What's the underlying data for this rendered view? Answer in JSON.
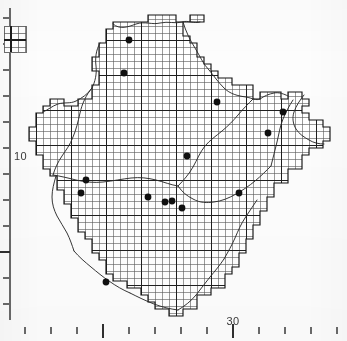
{
  "figure": {
    "background_color": "#fdfdfd",
    "ink_color": "#1a1a1a",
    "grid_color": "#4a4a4a",
    "dot_color": "#101010"
  },
  "axes": {
    "x_axis": {
      "label": "",
      "tick_labels": [
        {
          "value": "30",
          "x": 233
        }
      ],
      "minor_tick_x": [
        25,
        51,
        77,
        129,
        155,
        181,
        207,
        259,
        285,
        311,
        337
      ],
      "major_tick_x": [
        103,
        233
      ],
      "tick_y": 327,
      "minor_tick_len": 7,
      "major_tick_len": 11
    },
    "y_axis": {
      "label": "",
      "tick_labels": [
        {
          "value": "10",
          "y": 156
        }
      ],
      "axis_x": 10,
      "axis_top": 8,
      "axis_bottom": 320,
      "minor_tick_y": [
        18,
        44,
        70,
        96,
        122,
        148,
        174,
        200,
        226,
        278,
        304
      ],
      "major_tick_y": [
        252
      ],
      "minor_tick_len": 7,
      "major_tick_len": 11
    }
  },
  "inset_key": {
    "name": "scale-key-box",
    "x": 4,
    "y": 26,
    "width": 22,
    "height": 26,
    "cell_size": 7,
    "caption": ""
  },
  "map": {
    "grid": {
      "cell_size": 7.0,
      "origin_x": 29,
      "origin_y": 12,
      "bold_every": 5,
      "thin_width": 0.55,
      "bold_width": 1.0
    },
    "outline_path": "M 120 22 L 148 22 L 148 15 L 176 15 L 176 22 L 190 22 L 190 15 L 204 15 L 204 22 L 183 22 L 183 36 L 190 36 L 190 43 L 197 43 L 197 57 L 204 57 L 204 64 L 211 64 L 211 71 L 218 71 L 218 78 L 232 78 L 232 85 L 253 85 L 253 99 L 260 99 L 260 92 L 281 92 L 281 99 L 288 99 L 288 92 L 302 92 L 302 99 L 309 99 L 309 106 L 302 106 L 302 113 L 309 113 L 309 120 L 323 120 L 323 127 L 330 127 L 330 141 L 323 141 L 323 148 L 309 148 L 309 155 L 302 155 L 302 169 L 288 169 L 288 183 L 274 183 L 274 197 L 267 197 L 267 211 L 260 211 L 260 225 L 253 225 L 253 239 L 246 239 L 246 253 L 239 253 L 239 267 L 232 267 L 232 274 L 225 274 L 225 288 L 211 288 L 211 295 L 197 295 L 197 309 L 183 309 L 183 316 L 169 316 L 169 309 L 155 309 L 155 302 L 148 302 L 148 295 L 141 295 L 141 288 L 127 288 L 127 281 L 113 281 L 113 274 L 106 274 L 106 260 L 99 260 L 99 253 L 92 253 L 92 239 L 85 239 L 85 232 L 78 232 L 78 218 L 71 218 L 71 204 L 64 204 L 64 190 L 57 190 L 57 176 L 50 176 L 50 169 L 43 169 L 43 155 L 36 155 L 36 141 L 29 141 L 29 127 L 36 127 L 36 113 L 43 113 L 43 106 L 50 106 L 50 99 L 64 99 L 64 106 L 78 106 L 78 99 L 92 99 L 92 85 L 99 85 L 99 71 L 92 71 L 92 57 L 99 57 L 99 43 L 106 43 L 106 29 L 113 29 L 113 22 Z",
    "dots": [
      {
        "x": 129,
        "y": 40,
        "r": 3.4
      },
      {
        "x": 124,
        "y": 73,
        "r": 3.4
      },
      {
        "x": 217,
        "y": 102,
        "r": 3.4
      },
      {
        "x": 283,
        "y": 112,
        "r": 3.4
      },
      {
        "x": 268,
        "y": 133,
        "r": 3.4
      },
      {
        "x": 187,
        "y": 156,
        "r": 3.4
      },
      {
        "x": 86,
        "y": 180,
        "r": 3.4
      },
      {
        "x": 81,
        "y": 193,
        "r": 3.4
      },
      {
        "x": 148,
        "y": 197,
        "r": 3.4
      },
      {
        "x": 165,
        "y": 202,
        "r": 3.4
      },
      {
        "x": 172,
        "y": 201,
        "r": 3.4
      },
      {
        "x": 182,
        "y": 208,
        "r": 3.4
      },
      {
        "x": 239,
        "y": 193,
        "r": 3.4
      },
      {
        "x": 106,
        "y": 282,
        "r": 3.4
      }
    ],
    "dot_count": 14,
    "boundary_lines": "internal river / district boundary traces"
  }
}
